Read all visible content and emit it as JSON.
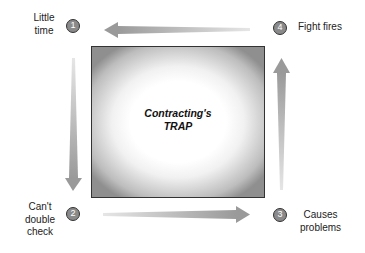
{
  "diagram": {
    "center_label_line1": "Contracting's",
    "center_label_line2": "TRAP",
    "steps": [
      {
        "number": "1",
        "label_line1": "Little",
        "label_line2": "time"
      },
      {
        "number": "2",
        "label_line1": "Can't",
        "label_line2": "double",
        "label_line3": "check"
      },
      {
        "number": "3",
        "label_line1": "Causes",
        "label_line2": "problems"
      },
      {
        "number": "4",
        "label_line1": "Fight fires"
      }
    ],
    "colors": {
      "arrow": "#9a9a9a",
      "badge_fill": "#8a8a8a",
      "badge_border": "#333333",
      "box_border": "#333333"
    }
  }
}
